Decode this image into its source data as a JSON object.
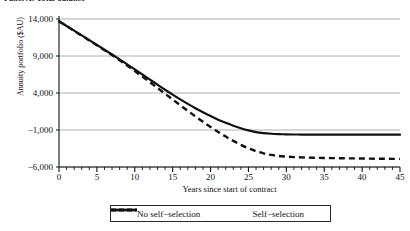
{
  "figure": {
    "title": "Panel A: Total balance",
    "width": 410,
    "height": 231
  },
  "chart_data": {
    "type": "line",
    "title": "Panel A: Total balance",
    "xlabel": "Years since start of contract",
    "ylabel": "Annuity portfolio ($AU)",
    "xlim": [
      0,
      45
    ],
    "ylim": [
      -6000,
      14000
    ],
    "xticks": [
      0,
      5,
      10,
      15,
      20,
      25,
      30,
      35,
      40,
      45
    ],
    "xticklabels": [
      "0",
      "5",
      "10",
      "15",
      "20",
      "25",
      "30",
      "35",
      "40",
      "45"
    ],
    "yticks": [
      14000,
      9000,
      4000,
      -1000,
      -6000
    ],
    "yticklabels": [
      "14,000",
      "9,000",
      "4,000",
      "−1,000",
      "−6,000"
    ],
    "minor_xtick_interval": 1,
    "grid": "horizontal",
    "legend_position": "below-axis",
    "x": [
      0,
      1,
      2,
      3,
      4,
      5,
      6,
      7,
      8,
      9,
      10,
      11,
      12,
      13,
      14,
      15,
      16,
      17,
      18,
      19,
      20,
      21,
      22,
      23,
      24,
      25,
      26,
      27,
      28,
      29,
      30,
      31,
      32,
      33,
      34,
      35,
      36,
      37,
      38,
      39,
      40,
      41,
      42,
      43,
      44,
      45
    ],
    "series": [
      {
        "name": "No self-selection",
        "label": "No self−selection",
        "style": "solid",
        "color": "#111111",
        "values": [
          13700,
          13060,
          12420,
          11780,
          11140,
          10500,
          9850,
          9200,
          8540,
          7870,
          7190,
          6500,
          5810,
          5120,
          4440,
          3780,
          3140,
          2530,
          1950,
          1400,
          880,
          400,
          -30,
          -420,
          -760,
          -1050,
          -1280,
          -1420,
          -1510,
          -1560,
          -1590,
          -1605,
          -1615,
          -1620,
          -1625,
          -1628,
          -1630,
          -1631,
          -1632,
          -1633,
          -1634,
          -1634,
          -1635,
          -1635,
          -1635,
          -1635
        ]
      },
      {
        "name": "Self-selection",
        "label": "Self−selection",
        "style": "dashed",
        "color": "#111111",
        "values": [
          13700,
          13050,
          12400,
          11750,
          11100,
          10450,
          9790,
          9120,
          8420,
          7700,
          6960,
          6210,
          5450,
          4680,
          3900,
          3120,
          2350,
          1590,
          840,
          110,
          -590,
          -1260,
          -1890,
          -2470,
          -3000,
          -3470,
          -3860,
          -4160,
          -4370,
          -4510,
          -4600,
          -4660,
          -4700,
          -4730,
          -4755,
          -4775,
          -4795,
          -4810,
          -4825,
          -4840,
          -4855,
          -4868,
          -4880,
          -4890,
          -4897,
          -4900
        ]
      }
    ]
  },
  "legend": {
    "entries": [
      {
        "label": "No self−selection",
        "style": "solid"
      },
      {
        "label": "Self−selection",
        "style": "dashed"
      }
    ]
  }
}
